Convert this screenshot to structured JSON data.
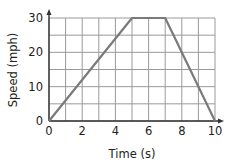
{
  "chart_data": {
    "type": "line",
    "title": "",
    "xlabel": "Time (s)",
    "ylabel": "Speed (mph)",
    "xlim": [
      0,
      10
    ],
    "ylim": [
      0,
      30
    ],
    "x_ticks": [
      0,
      2,
      4,
      6,
      8,
      10
    ],
    "y_ticks": [
      0,
      10,
      20,
      30
    ],
    "x_tick_labels": [
      "0",
      "2",
      "4",
      "6",
      "8",
      "10"
    ],
    "y_tick_labels": [
      "0",
      "10",
      "20",
      "30"
    ],
    "grid": true,
    "grid_x_step": 1,
    "grid_y_step": 5,
    "legend": null,
    "series": [
      {
        "name": "speed",
        "x": [
          0,
          5,
          7,
          10
        ],
        "values": [
          0,
          30,
          30,
          0
        ]
      }
    ]
  },
  "colors": {
    "line": "#7a7a7a",
    "grid": "#9a9a9a",
    "axis": "#333333",
    "text": "#222222"
  }
}
